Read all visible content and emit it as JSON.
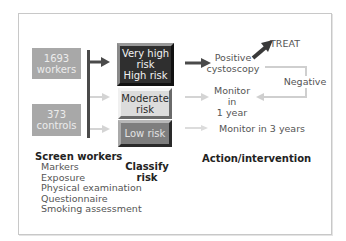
{
  "diagram": {
    "left_boxes": [
      {
        "number": "1693",
        "label": "workers"
      },
      {
        "number": "373",
        "label": "controls"
      }
    ],
    "risk_boxes": [
      {
        "line1": "Very high",
        "line2": "risk",
        "line3": "High risk"
      },
      {
        "line1": "Moderate",
        "line2": "risk"
      },
      {
        "line1": "Low risk"
      }
    ],
    "actions": {
      "positive_line1": "Positive",
      "positive_line2": "cystoscopy",
      "treat": "TREAT",
      "negative": "Negative",
      "monitor1_line1": "Monitor",
      "monitor1_line2": "in",
      "monitor1_line3": "1 year",
      "monitor3": "Monitor in 3 years"
    },
    "column_titles": {
      "screen": "Screen workers",
      "classify_line1": "Classify",
      "classify_line2": "risk",
      "action": "Action/intervention"
    },
    "screen_items": [
      "Markers",
      "Exposure",
      "Physical examination",
      "Questionnaire",
      "Smoking assessment"
    ],
    "colors": {
      "dark_arrow": "#4a4a4a",
      "light_arrow": "#cfcfcf",
      "grey_box": "#a8a8a8",
      "very_high_box": "#2f2f2f",
      "moderate_box": "#dcdcdc",
      "low_box": "#7e7e7e"
    }
  }
}
